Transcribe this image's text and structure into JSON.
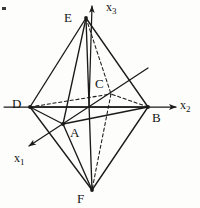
{
  "figure": {
    "kind": "hand-drawn 3d geometry diagram",
    "background_color": "#fdfdfc",
    "ink_color": "#1a1a1a",
    "width": 200,
    "height": 208
  },
  "axes": [
    {
      "id": "x3",
      "name": "x_3",
      "label": "x",
      "subscript": "3",
      "label_x": 106,
      "label_y": 1,
      "direction": "up",
      "arrow": true,
      "from": [
        89,
        107
      ],
      "to": [
        92,
        6
      ]
    },
    {
      "id": "x2",
      "name": "x_2",
      "label": "x",
      "subscript": "2",
      "label_x": 180,
      "label_y": 99,
      "direction": "right",
      "arrow": true,
      "from": [
        4,
        107
      ],
      "to": [
        176,
        107
      ]
    },
    {
      "id": "x1",
      "name": "x_1",
      "label": "x",
      "subscript": "1",
      "label_x": 14,
      "label_y": 152,
      "direction": "lower-left",
      "arrow": true,
      "from": [
        148,
        68
      ],
      "to": [
        29,
        146
      ]
    }
  ],
  "vertices": [
    {
      "id": "E",
      "label": "E",
      "x": 86,
      "y": 18,
      "label_x": 64,
      "label_y": 11,
      "hidden": false,
      "role": "top apex"
    },
    {
      "id": "D",
      "label": "D",
      "x": 30,
      "y": 107,
      "label_x": 12,
      "label_y": 97,
      "hidden": false,
      "role": "left base vertex on negative x2"
    },
    {
      "id": "B",
      "label": "B",
      "x": 148,
      "y": 107,
      "label_x": 152,
      "label_y": 111,
      "hidden": false,
      "role": "right base vertex on positive x2"
    },
    {
      "id": "A",
      "label": "A",
      "x": 63,
      "y": 124,
      "label_x": 70,
      "label_y": 126,
      "hidden": false,
      "role": "front base vertex on positive x1"
    },
    {
      "id": "C",
      "label": "C",
      "x": 111,
      "y": 94,
      "label_x": 95,
      "label_y": 77,
      "hidden": true,
      "role": "rear base vertex on negative x1"
    },
    {
      "id": "F",
      "label": "F",
      "x": 92,
      "y": 190,
      "label_x": 77,
      "label_y": 192,
      "hidden": false,
      "role": "bottom apex"
    }
  ],
  "edges": [
    {
      "from": "E",
      "to": "D",
      "style": "solid",
      "name": "edge-E-D"
    },
    {
      "from": "E",
      "to": "A",
      "style": "solid",
      "name": "edge-E-A"
    },
    {
      "from": "E",
      "to": "B",
      "style": "solid",
      "name": "edge-E-B"
    },
    {
      "from": "E",
      "to": "F",
      "style": "solid",
      "name": "edge-E-F"
    },
    {
      "from": "E",
      "to": "C",
      "style": "dashed",
      "name": "edge-E-C"
    },
    {
      "from": "D",
      "to": "A",
      "style": "solid",
      "name": "edge-D-A"
    },
    {
      "from": "D",
      "to": "B",
      "style": "solid",
      "name": "edge-D-B"
    },
    {
      "from": "D",
      "to": "F",
      "style": "solid",
      "name": "edge-D-F"
    },
    {
      "from": "D",
      "to": "C",
      "style": "dashed",
      "name": "edge-D-C"
    },
    {
      "from": "A",
      "to": "B",
      "style": "solid",
      "name": "edge-A-B"
    },
    {
      "from": "A",
      "to": "F",
      "style": "solid",
      "name": "edge-A-F"
    },
    {
      "from": "B",
      "to": "F",
      "style": "solid",
      "name": "edge-B-F"
    },
    {
      "from": "B",
      "to": "C",
      "style": "dashed",
      "name": "edge-C-B"
    },
    {
      "from": "C",
      "to": "F",
      "style": "dashed",
      "name": "edge-C-F"
    }
  ],
  "artifacts": [
    {
      "name": "scan-mark",
      "x": 2,
      "y": 7,
      "width": 4,
      "height": 3
    }
  ]
}
